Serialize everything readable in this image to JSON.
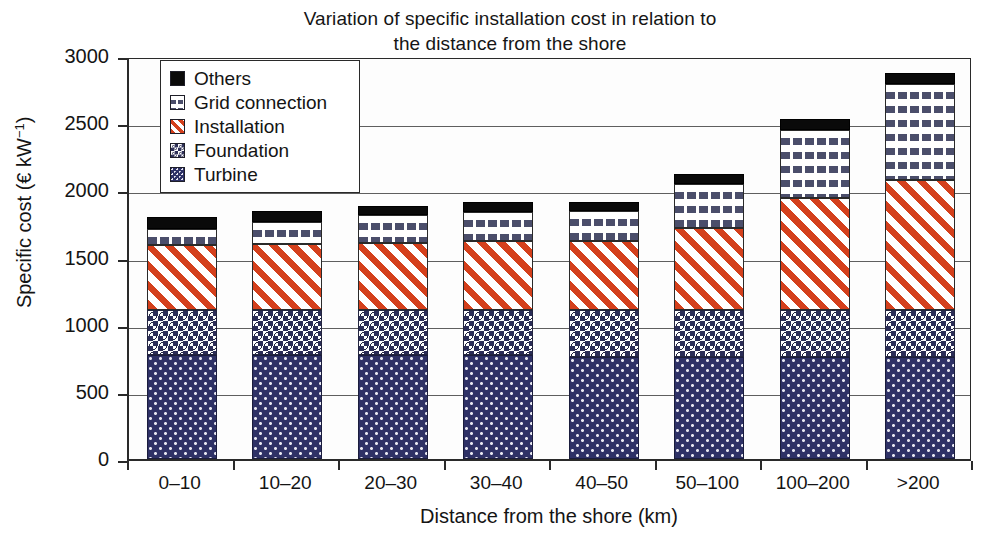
{
  "chart_data": {
    "type": "bar",
    "stacked": true,
    "title": "Variation of specific installation cost in relation to the distance from the shore",
    "title_line1": "Variation of specific installation cost in relation to",
    "title_line2": "the distance from the shore",
    "xlabel": "Distance from the shore (km)",
    "ylabel_text": "Specific cost (€ kW",
    "ylabel_sup": "−1",
    "ylabel_tail": ")",
    "ylabel": "Specific cost (€ kW⁻¹)",
    "categories": [
      "0–10",
      "10–20",
      "20–30",
      "30–40",
      "40–50",
      "50–100",
      "100–200",
      ">200"
    ],
    "ylim": [
      0,
      3000
    ],
    "ytick_values": [
      0,
      500,
      1000,
      1500,
      2000,
      2500,
      3000
    ],
    "ytick_labels": [
      "0",
      "500",
      "1000",
      "1500",
      "2000",
      "2500",
      "3000"
    ],
    "grid": true,
    "legend_position": "upper-left-inside",
    "series": [
      {
        "name": "Turbine",
        "key": "turbine",
        "swatch": "turbine-swatch",
        "color": "#2e3166",
        "pattern": "dotted-navy",
        "values": [
          775,
          775,
          775,
          775,
          760,
          760,
          760,
          760
        ]
      },
      {
        "name": "Foundation",
        "key": "foundation",
        "swatch": "foundation-swatch",
        "color": "#2b2d57",
        "pattern": "checker-navy",
        "values": [
          335,
          335,
          335,
          335,
          350,
          350,
          350,
          350
        ]
      },
      {
        "name": "Installation",
        "key": "installation",
        "swatch": "installation-swatch",
        "color": "#d4401c",
        "pattern": "diagonal-red",
        "values": [
          480,
          490,
          500,
          510,
          515,
          610,
          830,
          965
        ]
      },
      {
        "name": "Grid connection",
        "key": "grid",
        "swatch": "grid-swatch",
        "color": "#4b4e6b",
        "pattern": "vertical-dashes",
        "values": [
          120,
          165,
          210,
          220,
          220,
          330,
          510,
          715
        ]
      },
      {
        "name": "Others",
        "key": "others",
        "swatch": "others-swatch",
        "color": "#0a0a0a",
        "pattern": "solid-black",
        "values": [
          90,
          80,
          65,
          70,
          70,
          75,
          80,
          80
        ]
      }
    ],
    "totals": [
      1800,
      1845,
      1885,
      1910,
      1915,
      2125,
      2530,
      2870
    ],
    "legend_order": [
      "Others",
      "Grid connection",
      "Installation",
      "Foundation",
      "Turbine"
    ]
  }
}
